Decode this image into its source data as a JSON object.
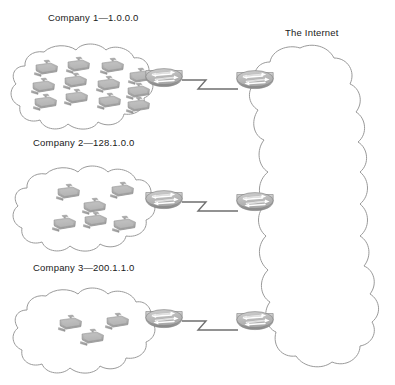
{
  "diagram": {
    "type": "network-topology",
    "title_visible": false,
    "background": "#ffffff",
    "line_color": "#9a9a9a",
    "device_fill_top": "#c9c9c9",
    "device_fill_bottom": "#8e8e8e",
    "text_color": "#1a1a1a"
  },
  "internet": {
    "label": "The Internet",
    "label_x": 292,
    "label_y": 28,
    "cloud": {
      "x": 258,
      "y": 46,
      "w": 116,
      "h": 328
    }
  },
  "sites": [
    {
      "id": "company-1",
      "label": "Company 1—1.0.0.0",
      "company_name": "Company 1",
      "network_address": "1.0.0.0",
      "label_x": 48,
      "label_y": 12,
      "cloud": {
        "x": 14,
        "y": 44,
        "w": 140,
        "h": 78
      },
      "host_count": 12,
      "hosts": [
        {
          "x": 34,
          "y": 60
        },
        {
          "x": 66,
          "y": 57
        },
        {
          "x": 100,
          "y": 58
        },
        {
          "x": 128,
          "y": 68
        },
        {
          "x": 31,
          "y": 78
        },
        {
          "x": 63,
          "y": 73
        },
        {
          "x": 96,
          "y": 76
        },
        {
          "x": 126,
          "y": 83
        },
        {
          "x": 33,
          "y": 94
        },
        {
          "x": 64,
          "y": 89
        },
        {
          "x": 97,
          "y": 93
        },
        {
          "x": 126,
          "y": 97
        }
      ],
      "router": {
        "id": "ce-router-1",
        "x": 163,
        "y": 81
      },
      "link": {
        "from": [
          182,
          81
        ],
        "to": [
          238,
          81
        ],
        "style": "serial-zigzag"
      },
      "isp_router": {
        "id": "pe-router-1",
        "x": 255,
        "y": 81
      }
    },
    {
      "id": "company-2",
      "label": "Company 2—128.1.0.0",
      "company_name": "Company 2",
      "network_address": "128.1.0.0",
      "label_x": 33,
      "label_y": 137,
      "cloud": {
        "x": 16,
        "y": 166,
        "w": 138,
        "h": 76
      },
      "host_count": 6,
      "hosts": [
        {
          "x": 56,
          "y": 184
        },
        {
          "x": 110,
          "y": 182
        },
        {
          "x": 82,
          "y": 198
        },
        {
          "x": 52,
          "y": 215
        },
        {
          "x": 83,
          "y": 212
        },
        {
          "x": 112,
          "y": 216
        }
      ],
      "router": {
        "id": "ce-router-2",
        "x": 163,
        "y": 203
      },
      "link": {
        "from": [
          182,
          203
        ],
        "to": [
          238,
          203
        ],
        "style": "serial-zigzag"
      },
      "isp_router": {
        "id": "pe-router-2",
        "x": 255,
        "y": 203
      }
    },
    {
      "id": "company-3",
      "label": "Company 3—200.1.1.0",
      "company_name": "Company 3",
      "network_address": "200.1.1.0",
      "label_x": 33,
      "label_y": 262,
      "cloud": {
        "x": 16,
        "y": 288,
        "w": 138,
        "h": 78
      },
      "host_count": 3,
      "hosts": [
        {
          "x": 58,
          "y": 315
        },
        {
          "x": 105,
          "y": 313
        },
        {
          "x": 80,
          "y": 329
        }
      ],
      "router": {
        "id": "ce-router-3",
        "x": 163,
        "y": 322
      },
      "link": {
        "from": [
          182,
          322
        ],
        "to": [
          238,
          322
        ],
        "style": "serial-zigzag"
      },
      "isp_router": {
        "id": "pe-router-3",
        "x": 255,
        "y": 322
      }
    }
  ],
  "legend": {
    "host_icon": "desktop-computer-icon",
    "router_icon": "router-icon",
    "cloud_icon": "network-cloud-icon",
    "link_icon": "serial-link-icon"
  }
}
